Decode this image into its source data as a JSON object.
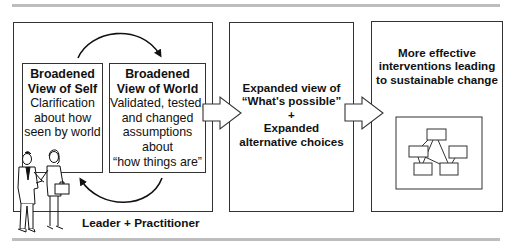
{
  "diagram": {
    "stage1": {
      "self_box": {
        "title_lines": [
          "Broadened",
          "View of Self"
        ],
        "body_lines": [
          "Clarification",
          "about how",
          "seen by world"
        ]
      },
      "world_box": {
        "title_lines": [
          "Broadened",
          "View of World"
        ],
        "body_lines": [
          "Validated, tested,",
          "and changed",
          "assumptions",
          "about",
          "“how things are”"
        ]
      },
      "caption": "Leader + Practitioner",
      "illustration": "two-people-handshake"
    },
    "stage2": {
      "lines": [
        "Expanded view of",
        "“What's possible”",
        "+",
        "Expanded",
        "alternative choices"
      ]
    },
    "stage3": {
      "lines": [
        "More effective",
        "interventions leading",
        "to sustainable change"
      ],
      "illustration": "network-diagram"
    },
    "connectors": [
      "cycle-arrow-self-to-world",
      "cycle-arrow-world-to-self",
      "block-arrow-stage1-to-stage2",
      "block-arrow-stage2-to-stage3"
    ]
  }
}
